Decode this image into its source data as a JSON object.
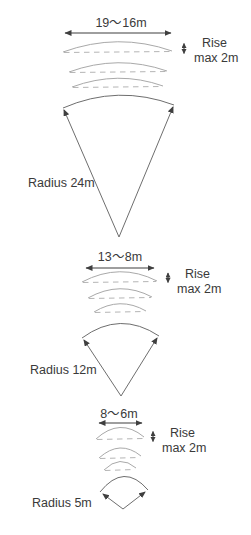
{
  "diagram": {
    "sections": [
      {
        "width_label": "19～16m",
        "rise_line1": "Rise",
        "rise_line2": "max 2m",
        "radius_label": "Radius 24m"
      },
      {
        "width_label": "13～8m",
        "rise_line1": "Rise",
        "rise_line2": "max 2m",
        "radius_label": "Radius 12m"
      },
      {
        "width_label": "8～6m",
        "rise_line1": "Rise",
        "rise_line2": "max 2m",
        "radius_label": "Radius 5m"
      }
    ],
    "colors": {
      "background": "#ffffff",
      "text": "#3a3a3a",
      "dimension_line": "#3f3f3f",
      "sector_line": "#6e6e6e",
      "arc_line": "#a9a9a9",
      "chord_dash": "#b5b5b5"
    }
  }
}
